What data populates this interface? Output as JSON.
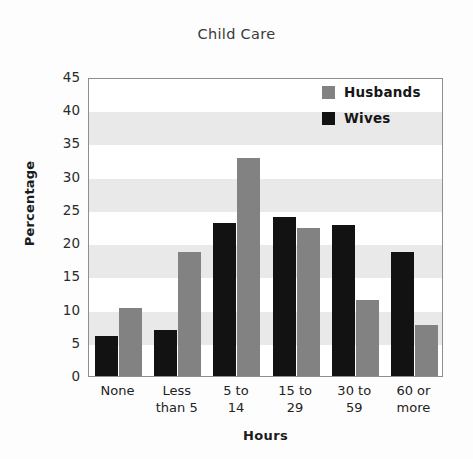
{
  "chart_data": {
    "type": "bar",
    "title": "Child Care",
    "xlabel": "Hours",
    "ylabel": "Percentage",
    "categories": [
      "None",
      "Less than 5",
      "5 to 14",
      "15 to 29",
      "30 to 59",
      "60 or more"
    ],
    "category_lines": [
      [
        "None",
        ""
      ],
      [
        "Less",
        "than 5"
      ],
      [
        "5 to",
        "14"
      ],
      [
        "15 to",
        "29"
      ],
      [
        "30 to",
        "59"
      ],
      [
        "60 or",
        "more"
      ]
    ],
    "series": [
      {
        "name": "Wives",
        "color": "#121212",
        "values": [
          6,
          7,
          23,
          24,
          22.8,
          18.7
        ]
      },
      {
        "name": "Husbands",
        "color": "#828282",
        "values": [
          10.2,
          18.7,
          32.8,
          22.3,
          11.4,
          7.7
        ]
      }
    ],
    "series_draw_order": [
      "Wives",
      "Husbands"
    ],
    "ylim": [
      0,
      45
    ],
    "ytick_step": 5,
    "yticks": [
      45,
      40,
      35,
      30,
      25,
      20,
      15,
      10,
      5,
      0
    ],
    "ytick_labels": [
      "45",
      "40",
      "35",
      "30",
      "25",
      "20",
      "15",
      "10",
      "5",
      "0"
    ],
    "grid": false,
    "banding": true,
    "band_color": "#e9e9e9",
    "band_ranges": [
      [
        5,
        10
      ],
      [
        15,
        20
      ],
      [
        25,
        30
      ],
      [
        35,
        40
      ]
    ],
    "legend_position": "top-right",
    "legend": [
      {
        "label": "Husbands",
        "color": "#828282"
      },
      {
        "label": "Wives",
        "color": "#121212"
      }
    ],
    "plot_border_color": "#8e8e8e",
    "background": "#ffffff"
  }
}
